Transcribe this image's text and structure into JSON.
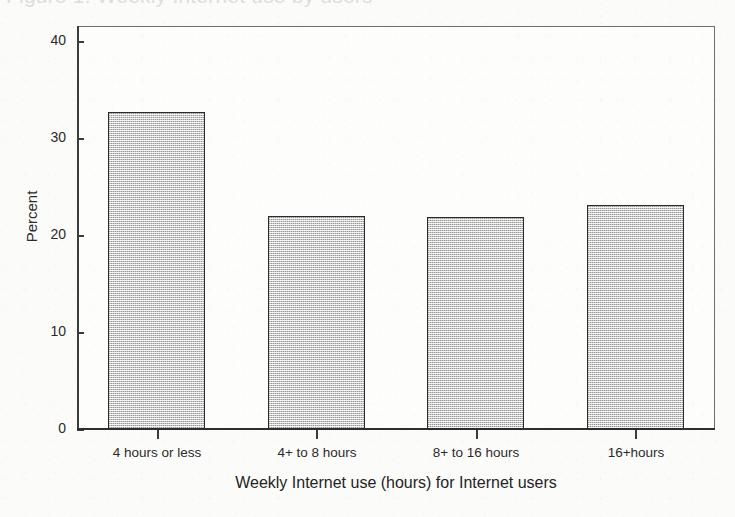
{
  "figure": {
    "background_color": "#fbfbfa",
    "title_remnant_text": "Figure 1. Weekly Internet use by users",
    "title_note": "chart title is cropped off at the top edge of the screenshot"
  },
  "axes": {
    "y_title": "Percent",
    "x_title": "Weekly Internet use (hours) for Internet users"
  },
  "chart_data": {
    "type": "bar",
    "title": "",
    "xlabel": "Weekly Internet use (hours) for Internet users",
    "ylabel": "Percent",
    "categories": [
      "4 hours or less",
      "4+ to 8 hours",
      "8+ to 16 hours",
      "16+hours"
    ],
    "values": [
      32.6,
      21.9,
      21.8,
      23.1
    ],
    "ylim": [
      0,
      41.5
    ],
    "yticks": [
      "0",
      "10",
      "20",
      "30",
      "40"
    ],
    "ytick_values": [
      0,
      10,
      20,
      30,
      40
    ],
    "grid": false,
    "legend": "none",
    "bar_fill_color": "#c9c9c9",
    "bar_edge_color": "#2a2a2a"
  }
}
